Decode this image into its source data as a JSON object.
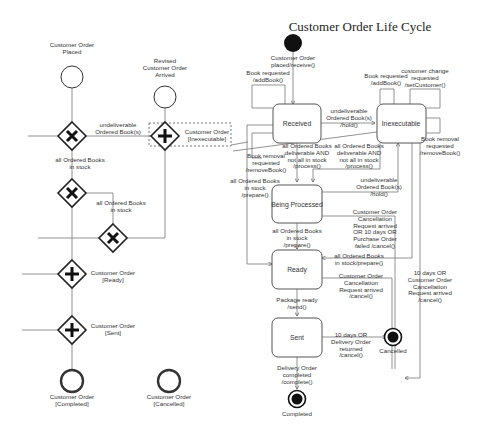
{
  "diagram_title": "Customer Order Life Cycle",
  "bpmn": {
    "events": {
      "placed": "Customer Order\nPlaced",
      "revised": "Revised\nCustomer Order\nArrived",
      "completed": "Customer Order\n[Completed]",
      "cancelled": "Customer Order\n[Cancelled]"
    },
    "flow_labels": {
      "undeliverable": "undeliverable\nOrdered Book(s)",
      "inexecutable": "Customer Order\n[Inexecutable]",
      "in_stock_1": "all Ordered Books\nin stock",
      "in_stock_2": "all Ordered Books\nin stock",
      "ready": "Customer Order\n[Ready]",
      "sent": "Customer Order\n[Sent]"
    }
  },
  "state_machine": {
    "states": {
      "received": "Received",
      "inexecutable": "Inexecutable",
      "being_processed": "Being Processed",
      "ready": "Ready",
      "sent": "Sent"
    },
    "final_states": {
      "cancelled": "Cancelled",
      "completed": "Completed"
    },
    "transitions": {
      "initial": "Customer Order\nplaced/receive()",
      "recv_addbook": "Book requested\n/addBook()",
      "recv_remove": "Book removal\nrequested\n/removeBook()",
      "recv_to_inexec": "undeliverable\nOrdered Book(s)\n/hold()",
      "recv_to_proc": "all Ordered Books\ndeliverable AND\nnot all in stock\n/process()",
      "recv_to_ready": "all Ordered Books\nin stock\n/prepare()",
      "inexec_addbook": "Book requested\n/addBook()",
      "inexec_setcust": "customer change\nrequested\n/setCustomer()",
      "inexec_remove": "Book removal\nrequested\n/removeBook()",
      "inexec_to_proc": "all Ordered Books\ndeliverable AND\nnot all in stock\n/process()",
      "proc_to_inexec": "undeliverable\nOrdered Book(s)\n/hold()",
      "proc_to_ready": "all Ordered Books\nin stock\n/prepare()",
      "proc_cancel": "Customer Order\nCancellation\nRequest arrived\nOR 10 days OR\nPurchase Order\nfailed /cancel()",
      "inexec_to_ready": "all Ordered Books\nin stock/prepare()",
      "ready_cancel": "Customer Order\nCancellation\nRequest arrived\n/cancel()",
      "inexec_cancel": "10 days OR\nCustomer Order\nCancellation\nRequest arrived\n/cancel()",
      "ready_to_sent": "Package ready\n/send()",
      "sent_cancel": "10 days OR\nDelivery Order\nreturned\n/cancel()",
      "sent_to_completed": "Delivery Order\ncompleted\n/complete()"
    }
  }
}
